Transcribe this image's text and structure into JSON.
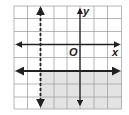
{
  "graph": {
    "axes": {
      "x_label": "x",
      "y_label": "y",
      "origin_label": "O"
    },
    "grid": {
      "x_min": -5,
      "x_max": 3,
      "y_min": -5,
      "y_max": 3,
      "step": 1
    },
    "boundary_lines": [
      {
        "equation": "x = -3",
        "style": "dashed",
        "orientation": "vertical"
      },
      {
        "equation": "y = -2",
        "style": "solid",
        "orientation": "horizontal"
      }
    ],
    "shaded_region": {
      "description": "x > -3 and y <= -2",
      "color": "#e3e3e3"
    },
    "colors": {
      "grid": "#9a9a9a",
      "lines": "#222222",
      "shade": "#e3e3e3"
    }
  }
}
